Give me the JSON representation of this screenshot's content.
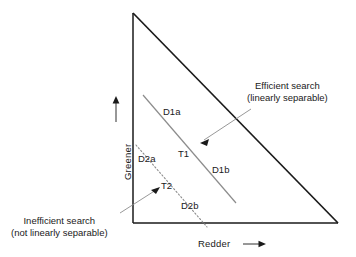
{
  "figure": {
    "type": "diagram",
    "axes": {
      "x_label": "Redder",
      "x_arrow": "right-arrow",
      "y_label": "Greener",
      "y_arrow": "up-arrow"
    },
    "triangle": {
      "apex": [
        133,
        13
      ],
      "bottom_left": [
        133,
        223
      ],
      "bottom_right": [
        338,
        223
      ],
      "stroke": "#1a1a1a"
    },
    "distractor_lines": [
      {
        "name": "D1",
        "style": "solid",
        "stroke": "#8c8c8c",
        "from": [
          143,
          95
        ],
        "to": [
          236,
          203
        ],
        "endpoint_labels": [
          "D1a",
          "D1b"
        ],
        "target_label": "T1"
      },
      {
        "name": "D2",
        "style": "dotted",
        "stroke": "#8c8c8c",
        "from": [
          136,
          145
        ],
        "to": [
          207,
          227
        ],
        "endpoint_labels": [
          "D2a",
          "D2b"
        ],
        "target_label": "T2"
      }
    ],
    "point_labels": [
      {
        "id": "d1a",
        "text": "D1a",
        "x": 163,
        "y": 108
      },
      {
        "id": "t1",
        "text": "T1",
        "x": 178,
        "y": 150
      },
      {
        "id": "d1b",
        "text": "D1b",
        "x": 212,
        "y": 166
      },
      {
        "id": "d2a",
        "text": "D2a",
        "x": 139,
        "y": 155
      },
      {
        "id": "t2",
        "text": "T2",
        "x": 161,
        "y": 182
      },
      {
        "id": "d2b",
        "text": "D2b",
        "x": 182,
        "y": 202
      }
    ],
    "callouts": [
      {
        "id": "efficient",
        "line1": "Efficient search",
        "line2": "(linearly separable)",
        "x": 248,
        "y": 82,
        "leader_from": [
          250,
          110
        ],
        "leader_to": [
          201,
          142
        ]
      },
      {
        "id": "inefficient",
        "line1": "Inefficient search",
        "line2": "(not linearly separable)",
        "x": 12,
        "y": 216,
        "leader_from": [
          121,
          213
        ],
        "leader_to": [
          158,
          188
        ]
      }
    ]
  }
}
